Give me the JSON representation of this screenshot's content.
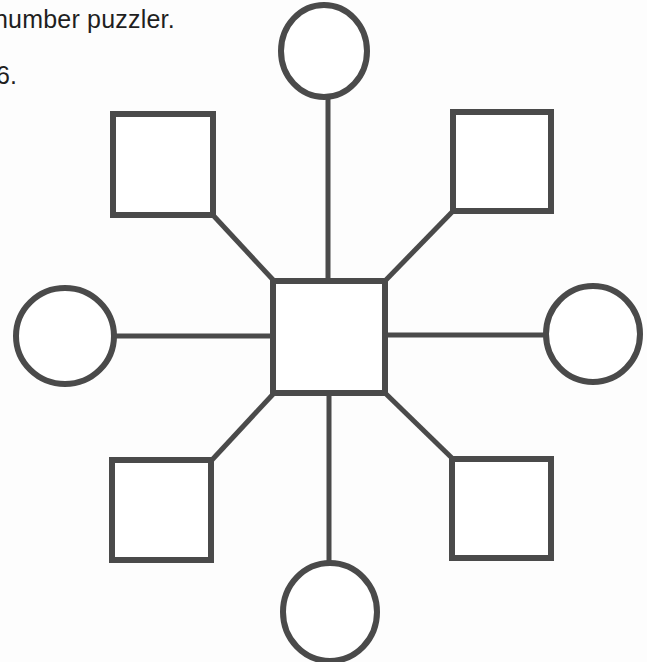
{
  "page": {
    "background_color": "#fdfdfd",
    "width": 647,
    "height": 662
  },
  "caption": {
    "line_text": "number puzzler.",
    "item_number": "6."
  },
  "diagram": {
    "title": "number puzzler",
    "stroke_color": "#4a4a4a",
    "fill_color": "#ffffff",
    "stroke_width": 5,
    "nodes": [
      {
        "id": "center-square",
        "shape": "square",
        "position": "center",
        "value": "",
        "cx": 329,
        "cy": 337,
        "size": 112
      },
      {
        "id": "circle-top",
        "shape": "circle",
        "position": "top",
        "value": "",
        "cx": 324,
        "cy": 51,
        "rx": 44,
        "ry": 47
      },
      {
        "id": "circle-bottom",
        "shape": "circle",
        "position": "bottom",
        "value": "",
        "cx": 330,
        "cy": 612,
        "rx": 47,
        "ry": 50
      },
      {
        "id": "circle-left",
        "shape": "circle",
        "position": "left",
        "value": "",
        "cx": 65,
        "cy": 336,
        "rx": 49,
        "ry": 48
      },
      {
        "id": "circle-right",
        "shape": "circle",
        "position": "right",
        "value": "",
        "cx": 593,
        "cy": 334,
        "rx": 48,
        "ry": 48
      },
      {
        "id": "square-top-left",
        "shape": "square",
        "position": "top-left",
        "value": "",
        "cx": 163,
        "cy": 164,
        "size": 100
      },
      {
        "id": "square-top-right",
        "shape": "square",
        "position": "top-right",
        "value": "",
        "cx": 502,
        "cy": 161,
        "size": 99
      },
      {
        "id": "square-bottom-left",
        "shape": "square",
        "position": "bottom-left",
        "value": "",
        "cx": 161,
        "cy": 510,
        "size": 99
      },
      {
        "id": "square-bottom-right",
        "shape": "square",
        "position": "bottom-right",
        "value": "",
        "cx": 501,
        "cy": 508,
        "size": 99
      }
    ],
    "connectors": [
      {
        "id": "spoke-top",
        "from": "center-square",
        "to": "circle-top",
        "type": "vertical"
      },
      {
        "id": "spoke-bottom",
        "from": "center-square",
        "to": "circle-bottom",
        "type": "vertical"
      },
      {
        "id": "spoke-left",
        "from": "center-square",
        "to": "circle-left",
        "type": "horizontal"
      },
      {
        "id": "spoke-right",
        "from": "center-square",
        "to": "circle-right",
        "type": "horizontal"
      },
      {
        "id": "spoke-top-left",
        "from": "center-square",
        "to": "square-top-left",
        "type": "diagonal"
      },
      {
        "id": "spoke-top-right",
        "from": "center-square",
        "to": "square-top-right",
        "type": "diagonal"
      },
      {
        "id": "spoke-bottom-left",
        "from": "center-square",
        "to": "square-bottom-left",
        "type": "diagonal"
      },
      {
        "id": "spoke-bottom-right",
        "from": "center-square",
        "to": "square-bottom-right",
        "type": "diagonal"
      }
    ]
  }
}
